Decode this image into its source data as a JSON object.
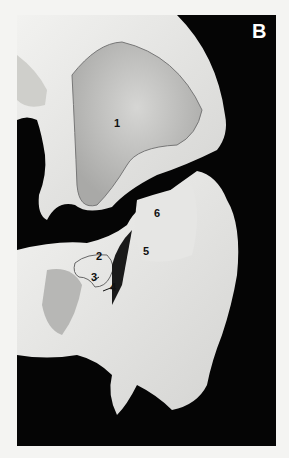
{
  "figure": {
    "panel_letter": "B",
    "labels": [
      {
        "id": "1",
        "text": "1",
        "x": 114,
        "y": 118
      },
      {
        "id": "2",
        "text": "2",
        "x": 96,
        "y": 251
      },
      {
        "id": "3",
        "text": "3",
        "x": 91,
        "y": 272
      },
      {
        "id": "4",
        "text": "4",
        "x": 110,
        "y": 282
      },
      {
        "id": "5",
        "text": "5",
        "x": 143,
        "y": 246
      },
      {
        "id": "6",
        "text": "6",
        "x": 154,
        "y": 208
      }
    ],
    "colors": {
      "background": "#050505",
      "bone": "#e8e8e6",
      "page": "#f4f4f2",
      "outline": "#7a7a7a"
    }
  }
}
